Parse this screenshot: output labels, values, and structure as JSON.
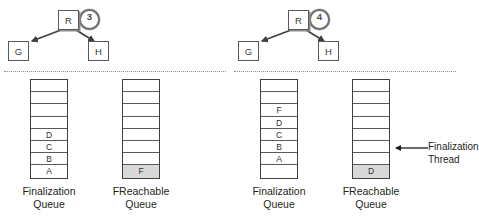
{
  "diagram": {
    "panels": [
      {
        "step": "3",
        "graph": {
          "root": "R",
          "left_child": "G",
          "right_child": "H"
        },
        "queues": [
          {
            "name": "finalization-queue",
            "label_line1": "Finalization",
            "label_line2": "Queue",
            "cells": [
              "",
              "",
              "",
              "",
              "D",
              "C",
              "B",
              "A"
            ],
            "filled": [
              false,
              false,
              false,
              false,
              false,
              false,
              false,
              false
            ]
          },
          {
            "name": "freachable-queue",
            "label_line1": "FReachable",
            "label_line2": "Queue",
            "cells": [
              "",
              "",
              "",
              "",
              "",
              "",
              "",
              "F"
            ],
            "filled": [
              false,
              false,
              false,
              false,
              false,
              false,
              false,
              true
            ]
          }
        ],
        "callout": null
      },
      {
        "step": "4",
        "graph": {
          "root": "R",
          "left_child": "G",
          "right_child": "H"
        },
        "queues": [
          {
            "name": "finalization-queue",
            "label_line1": "Finalization",
            "label_line2": "Queue",
            "cells": [
              "",
              "",
              "F",
              "D",
              "C",
              "B",
              "A",
              ""
            ],
            "filled": [
              false,
              false,
              false,
              false,
              false,
              false,
              false,
              false
            ]
          },
          {
            "name": "freachable-queue",
            "label_line1": "FReachable",
            "label_line2": "Queue",
            "cells": [
              "",
              "",
              "",
              "",
              "",
              "",
              "",
              "D"
            ],
            "filled": [
              false,
              false,
              false,
              false,
              false,
              false,
              false,
              true
            ]
          }
        ],
        "callout": {
          "line1": "Finalization",
          "line2": "Thread"
        }
      }
    ]
  },
  "colors": {
    "stroke": "#404040",
    "fill": "#d9d9d9",
    "text": "#231f20",
    "divider": "#8d8d8d"
  }
}
